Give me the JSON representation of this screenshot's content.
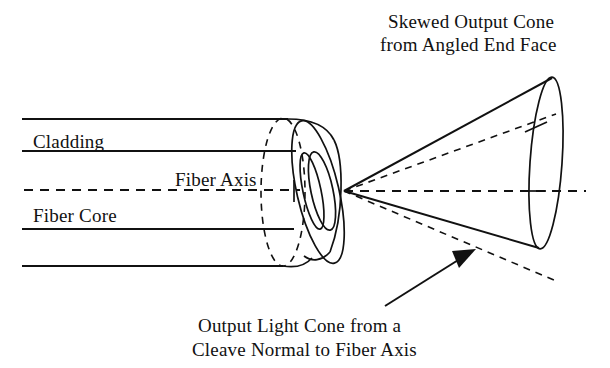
{
  "figure": {
    "background_color": "#ffffff",
    "ink_color": "#111111",
    "width": 610,
    "height": 368
  },
  "labels": {
    "skewed_cone_line1": "Skewed Output Cone",
    "skewed_cone_line2": "from Angled End Face",
    "cladding": "Cladding",
    "fiber_axis": "Fiber Axis",
    "fiber_core": "Fiber Core",
    "normal_cone_line1": "Output Light Cone from a",
    "normal_cone_line2": "Cleave Normal to Fiber Axis"
  },
  "geometry": {
    "fiber": {
      "cladding_top_y": 119,
      "core_top_y": 151,
      "core_bottom_y": 229,
      "cladding_bottom_y": 266,
      "left_x": 22,
      "end_x": 300,
      "axis_y": 190
    },
    "cones": {
      "apex": [
        344,
        191
      ],
      "skewed_far_center": [
        545,
        163
      ],
      "skewed_far_top": [
        552,
        78
      ],
      "skewed_far_bottom": [
        538,
        248
      ],
      "normal_far_center": [
        560,
        191
      ],
      "normal_half_angle_deg": 20
    },
    "callout_arrow": {
      "tail": [
        385,
        306
      ],
      "tip": [
        476,
        249
      ]
    }
  }
}
